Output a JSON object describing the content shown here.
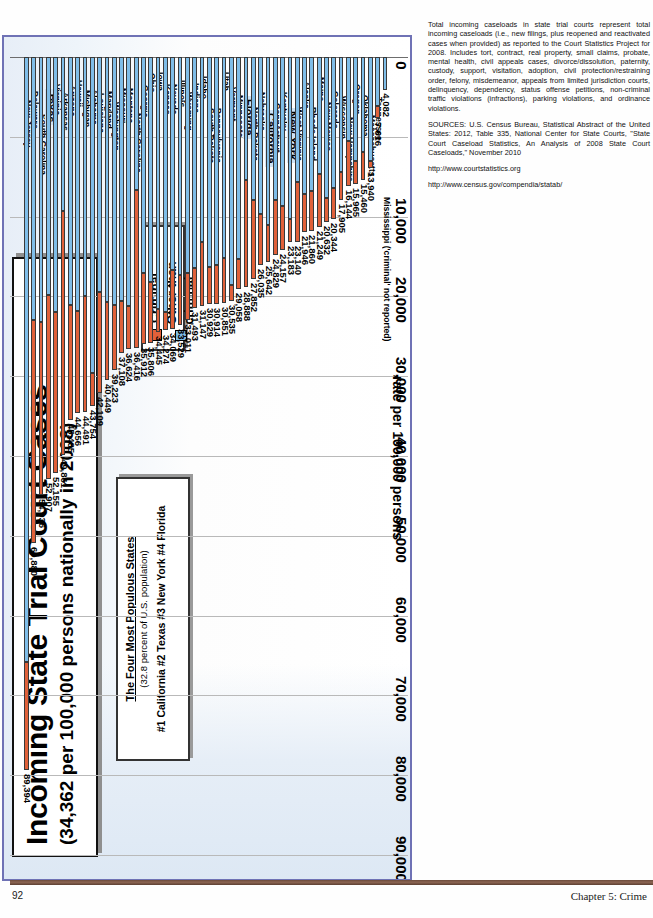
{
  "page": {
    "folio": "92",
    "chapter": "Chapter 5: Crime"
  },
  "chart": {
    "title": "Incoming State Trial Court Cases",
    "subtitle": "(34,362 per 100,000 persons nationally in 2008)",
    "callout": {
      "heading": "The Four Most Populous States",
      "subheading": "(32.8 percent of U.S. population)",
      "list": "#1 California  #2 Texas  #3 New York  #4 Florida"
    },
    "legend": {
      "items": [
        {
          "label": "Criminal",
          "color": "#e0613a"
        },
        {
          "label": "Other than criminal",
          "color": "#7fbde8"
        }
      ]
    }
  },
  "notes": {
    "paragraph": "Total incoming caseloads in state trial courts represent total incoming caseloads (i.e., new filings, plus reopened and reactivated cases when provided) as reported to the Court Statistics Project for 2008. Includes tort, contract, real property, small claims, probate, mental health, civil appeals cases, divorce/dissolution, paternity, custody, support, visitation, adoption, civil protection/restraining order, felony, misdemeanor, appeals from limited jurisdiction courts, delinquency, dependency, status offense petitions, non-criminal traffic violations (infractions), parking violations, and ordinance violations.",
    "sources": "SOURCES: U.S. Census Bureau, Statistical Abstract of the United States: 2012, Table 335, National Center for State Courts, \"State Court Caseload Statistics, An Analysis of 2008 State Court Caseloads,\" November 2010",
    "link1": "http://www.courtstatistics.org",
    "link2": "http://www.census.gov/compendia/statab/"
  },
  "chart_data": {
    "type": "bar",
    "orientation": "horizontal",
    "stacked": true,
    "title": "Incoming State Trial Court Cases",
    "subtitle": "(34,362 per 100,000 persons nationally in 2008)",
    "xlabel": "rate per 100,000 persons",
    "ylabel": "",
    "xlim": [
      0,
      100000
    ],
    "xticks": [
      "0",
      "10,000",
      "20,000",
      "30,000",
      "40,000",
      "50,000",
      "60,000",
      "70,000",
      "80,000",
      "90,000",
      "100,000"
    ],
    "grid": true,
    "legend_position": "top-right",
    "series_names": [
      "Criminal",
      "Other than criminal"
    ],
    "series_colors": [
      "#e0613a",
      "#7fbde8"
    ],
    "categories": [
      "New Jersey",
      "Delaware",
      "South Carolina",
      "Texas",
      "Virginia",
      "Arkansas",
      "Arizona",
      "Hawaii",
      "Michigan",
      "Alabama",
      "Louisiana",
      "Maryland",
      "Washington",
      "Missouri",
      "Montana",
      "North Carolina",
      "Georgia",
      "Ohio",
      "Iowa",
      "Kansas",
      "Nevada",
      "Illinois",
      "Wyoming",
      "Indiana",
      "Idaho",
      "South Dakota",
      "Pennsylvania",
      "Utah",
      "Vermont",
      "Minnesota",
      "Florida",
      "North Dakota",
      "Nebraska",
      "California",
      "Connecticut",
      "Kentucky",
      "New York",
      "West Virginia",
      "Alaska",
      "Rhode Island",
      "Maine",
      "New Mexico",
      "Colorado",
      "Wisconsin",
      "New Hampshire",
      "Oregon",
      "Oklahoma",
      "Massachusetts",
      "Tennessee",
      "Mississippi"
    ],
    "totals": [
      89394,
      60880,
      54936,
      52907,
      52155,
      49861,
      45485,
      44656,
      44491,
      43754,
      42109,
      40449,
      39223,
      37108,
      36624,
      36416,
      35912,
      35806,
      34445,
      34274,
      34069,
      33529,
      33011,
      31493,
      31147,
      30929,
      30914,
      30851,
      30535,
      29058,
      28888,
      27852,
      26035,
      25642,
      24829,
      24157,
      23183,
      23140,
      21946,
      21860,
      21249,
      20632,
      20344,
      17905,
      16144,
      15965,
      15460,
      13940,
      7616,
      4082
    ],
    "criminal": [
      13600,
      27900,
      21700,
      23100,
      20200,
      30500,
      14400,
      12800,
      14600,
      4200,
      12700,
      9800,
      8200,
      6500,
      5400,
      19800,
      8800,
      7600,
      2900,
      2300,
      7400,
      6200,
      5900,
      5100,
      8000,
      4600,
      4900,
      5700,
      1900,
      3800,
      13500,
      9900,
      6400,
      4600,
      6900,
      5500,
      2900,
      7500,
      4800,
      5100,
      6600,
      3000,
      3900,
      3500,
      5600,
      2900,
      3500,
      900,
      1500,
      0
    ],
    "highlighted": [
      "Texas",
      "Florida",
      "California",
      "New York"
    ],
    "note_labels": {
      "Mississippi": "Mississippi ('criminal' not reported)"
    },
    "national_average": 34362
  }
}
